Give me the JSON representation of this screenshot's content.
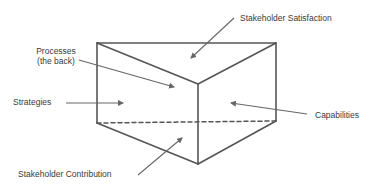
{
  "diagram": {
    "shape": "triangular-prism",
    "colors": {
      "edge": "#555555",
      "arrow": "#666666",
      "text": "#3a3a3a",
      "background": "#ffffff"
    },
    "labels": {
      "stakeholder_satisfaction": "Stakeholder Satisfaction",
      "processes_line1": "Processes",
      "processes_line2": "(the back)",
      "strategies": "Strategies",
      "capabilities": "Capabilities",
      "stakeholder_contribution": "Stakeholder Contribution"
    },
    "faces": [
      {
        "id": "top",
        "label": "Stakeholder Satisfaction"
      },
      {
        "id": "back",
        "label": "Processes (the back)"
      },
      {
        "id": "left",
        "label": "Strategies"
      },
      {
        "id": "right",
        "label": "Capabilities"
      },
      {
        "id": "bottom",
        "label": "Stakeholder Contribution"
      }
    ]
  }
}
